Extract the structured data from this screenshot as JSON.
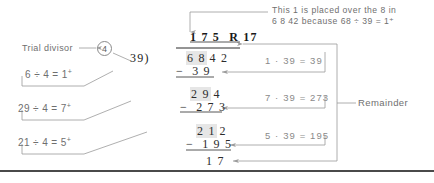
{
  "diagram": {
    "colors": {
      "annotation_text": "#6f6f6f",
      "math_text": "#2b2b2b",
      "right_calc_text": "#8a8a8a",
      "line": "#9a9a9a",
      "highlight": "#e6e6e6",
      "bottom_rule": "#4a4a4a"
    }
  },
  "top_note": {
    "line1": "This 1 is placed over the 8 in",
    "line2": "6 8 42 because 68 ÷ 39 = 1⁺",
    "line2_parts": {
      "prefix": "6 8 42 because 68 ÷ 39 = 1",
      "sup": "+"
    }
  },
  "trial_divisor": {
    "label": "Trial divisor",
    "value": "4"
  },
  "division": {
    "quotient": "1 7 5",
    "remainder_label": "R 17",
    "divisor": "39",
    "bracket": ")",
    "dividend_highlight": "6 8",
    "dividend_rest": "4 2",
    "steps": [
      {
        "minus": "−",
        "value": "3 9"
      },
      {
        "minus": "",
        "value": "2 9 4",
        "highlight": "2 9"
      },
      {
        "minus": "−",
        "value": "2 7 3"
      },
      {
        "minus": "",
        "value": "2 1 2",
        "highlight": "2 1"
      },
      {
        "minus": "−",
        "value": "1 9 5"
      },
      {
        "minus": "",
        "value": "1 7"
      }
    ]
  },
  "left_notes": [
    {
      "text": "6 ÷ 4 = 1",
      "sup": "+"
    },
    {
      "text": "29 ÷ 4 = 7",
      "sup": "+"
    },
    {
      "text": "21 ÷ 4 = 5",
      "sup": "+"
    }
  ],
  "right_calcs": [
    {
      "text": "1 · 39 = 39"
    },
    {
      "text": "7 · 39 = 273"
    },
    {
      "text": "5 · 39 = 195"
    }
  ],
  "remainder_note": {
    "label": "Remainder"
  }
}
